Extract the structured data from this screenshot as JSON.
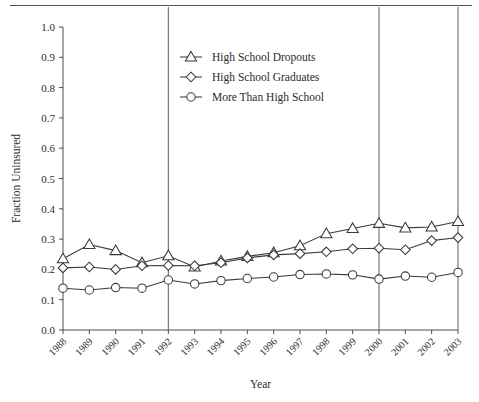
{
  "chart_data": {
    "type": "line",
    "title": "",
    "xlabel": "Year",
    "ylabel": "Fraction Uninsured",
    "x": [
      1988,
      1989,
      1990,
      1991,
      1992,
      1993,
      1994,
      1995,
      1996,
      1997,
      1998,
      1999,
      2000,
      2001,
      2002,
      2003
    ],
    "categories": [
      "1988",
      "1989",
      "1990",
      "1991",
      "1992",
      "1993",
      "1994",
      "1995",
      "1996",
      "1997",
      "1998",
      "1999",
      "2000",
      "2001",
      "2002",
      "2003"
    ],
    "xlim": [
      1988,
      2003
    ],
    "ylim": [
      0.0,
      1.0
    ],
    "ytick_labels": [
      "0.0",
      "0.1",
      "0.2",
      "0.3",
      "0.4",
      "0.5",
      "0.6",
      "0.7",
      "0.8",
      "0.9",
      "1.0"
    ],
    "ytick_values": [
      0.0,
      0.1,
      0.2,
      0.3,
      0.4,
      0.5,
      0.6,
      0.7,
      0.8,
      0.9,
      1.0
    ],
    "grid": false,
    "legend_position": "upper-center",
    "reference_lines": [
      {
        "x": 1992,
        "orientation": "vertical"
      },
      {
        "x": 2000,
        "orientation": "vertical"
      }
    ],
    "series": [
      {
        "name": "High  School Dropouts",
        "marker": "triangle",
        "values": [
          0.235,
          0.282,
          0.262,
          0.222,
          0.245,
          0.208,
          0.228,
          0.243,
          0.255,
          0.278,
          0.318,
          0.335,
          0.352,
          0.337,
          0.34,
          0.358
        ]
      },
      {
        "name": "High School Graduates",
        "marker": "diamond",
        "values": [
          0.205,
          0.208,
          0.2,
          0.212,
          0.213,
          0.212,
          0.222,
          0.238,
          0.248,
          0.252,
          0.258,
          0.268,
          0.27,
          0.265,
          0.295,
          0.305
        ]
      },
      {
        "name": "More Than High School",
        "marker": "circle",
        "values": [
          0.138,
          0.132,
          0.14,
          0.138,
          0.165,
          0.152,
          0.163,
          0.17,
          0.175,
          0.183,
          0.185,
          0.182,
          0.168,
          0.178,
          0.174,
          0.19
        ]
      }
    ]
  },
  "legend": {
    "entries": [
      {
        "label": "High  School Dropouts",
        "marker": "triangle"
      },
      {
        "label": "High School Graduates",
        "marker": "diamond"
      },
      {
        "label": "More Than High School",
        "marker": "circle"
      }
    ]
  },
  "axes": {
    "x_title": "Year",
    "y_title": "Fraction Uninsured"
  }
}
